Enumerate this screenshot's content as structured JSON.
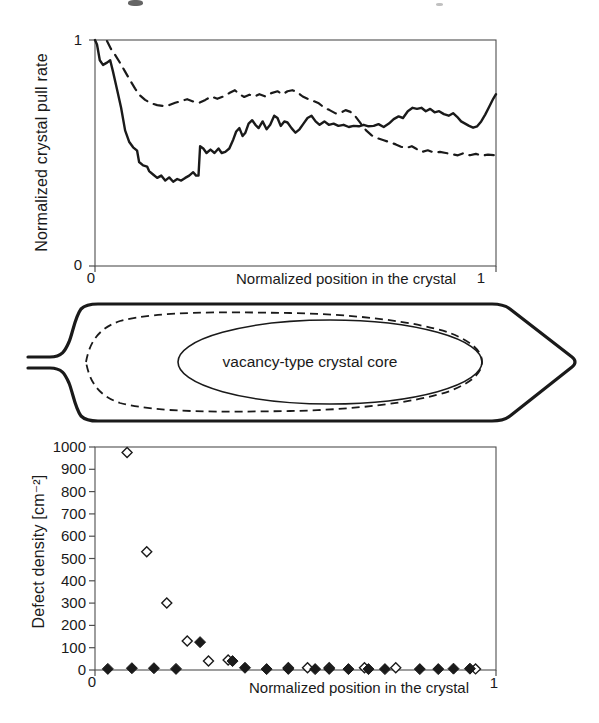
{
  "figure": {
    "top": {
      "ylabel": "Normalized crystal pull rate",
      "xlabel": "Normalized position in the crystal",
      "ytick_top": "1",
      "ytick_bottom": "0",
      "xtick_left": "0",
      "xtick_right": "1"
    },
    "middle": {
      "core_label": "vacancy-type crystal core"
    },
    "bottom": {
      "ylabel": "Defect density [cm⁻²]",
      "xlabel": "Normalized  position in the crystal",
      "xtick_left": "0",
      "xtick_right": "1"
    }
  },
  "chart_data": [
    {
      "type": "line",
      "title": "",
      "xlabel": "Normalized position in the crystal",
      "ylabel": "Normalized crystal pull rate",
      "xlim": [
        0,
        1
      ],
      "ylim": [
        0,
        1
      ],
      "x_ticks": [
        "0",
        "1"
      ],
      "y_ticks": [
        "0",
        "1"
      ],
      "grid": false,
      "legend": "none",
      "series": [
        {
          "name": "solid-curve",
          "style": "solid",
          "points": [
            [
              0,
              1.0
            ],
            [
              0.005,
              0.98
            ],
            [
              0.012,
              0.91
            ],
            [
              0.02,
              0.89
            ],
            [
              0.03,
              0.9
            ],
            [
              0.038,
              0.91
            ],
            [
              0.045,
              0.86
            ],
            [
              0.055,
              0.78
            ],
            [
              0.065,
              0.7
            ],
            [
              0.075,
              0.6
            ],
            [
              0.085,
              0.55
            ],
            [
              0.095,
              0.525
            ],
            [
              0.105,
              0.51
            ],
            [
              0.11,
              0.46
            ],
            [
              0.12,
              0.445
            ],
            [
              0.13,
              0.44
            ],
            [
              0.135,
              0.42
            ],
            [
              0.145,
              0.405
            ],
            [
              0.155,
              0.39
            ],
            [
              0.165,
              0.4
            ],
            [
              0.175,
              0.378
            ],
            [
              0.185,
              0.392
            ],
            [
              0.195,
              0.373
            ],
            [
              0.205,
              0.385
            ],
            [
              0.215,
              0.378
            ],
            [
              0.225,
              0.39
            ],
            [
              0.235,
              0.4
            ],
            [
              0.245,
              0.415
            ],
            [
              0.252,
              0.4
            ],
            [
              0.258,
              0.4
            ],
            [
              0.262,
              0.53
            ],
            [
              0.27,
              0.52
            ],
            [
              0.278,
              0.5
            ],
            [
              0.288,
              0.515
            ],
            [
              0.298,
              0.5
            ],
            [
              0.308,
              0.52
            ],
            [
              0.316,
              0.5
            ],
            [
              0.325,
              0.505
            ],
            [
              0.335,
              0.52
            ],
            [
              0.345,
              0.56
            ],
            [
              0.352,
              0.595
            ],
            [
              0.36,
              0.61
            ],
            [
              0.368,
              0.575
            ],
            [
              0.375,
              0.59
            ],
            [
              0.383,
              0.63
            ],
            [
              0.392,
              0.645
            ],
            [
              0.4,
              0.625
            ],
            [
              0.408,
              0.61
            ],
            [
              0.418,
              0.64
            ],
            [
              0.428,
              0.605
            ],
            [
              0.437,
              0.625
            ],
            [
              0.447,
              0.665
            ],
            [
              0.455,
              0.655
            ],
            [
              0.463,
              0.62
            ],
            [
              0.472,
              0.64
            ],
            [
              0.48,
              0.635
            ],
            [
              0.49,
              0.61
            ],
            [
              0.5,
              0.59
            ],
            [
              0.51,
              0.605
            ],
            [
              0.52,
              0.63
            ],
            [
              0.53,
              0.655
            ],
            [
              0.54,
              0.665
            ],
            [
              0.55,
              0.64
            ],
            [
              0.56,
              0.625
            ],
            [
              0.572,
              0.64
            ],
            [
              0.583,
              0.625
            ],
            [
              0.595,
              0.63
            ],
            [
              0.607,
              0.62
            ],
            [
              0.62,
              0.625
            ],
            [
              0.633,
              0.615
            ],
            [
              0.645,
              0.62
            ],
            [
              0.658,
              0.618
            ],
            [
              0.67,
              0.625
            ],
            [
              0.682,
              0.618
            ],
            [
              0.695,
              0.62
            ],
            [
              0.707,
              0.628
            ],
            [
              0.72,
              0.615
            ],
            [
              0.733,
              0.63
            ],
            [
              0.745,
              0.65
            ],
            [
              0.757,
              0.662
            ],
            [
              0.768,
              0.655
            ],
            [
              0.78,
              0.685
            ],
            [
              0.792,
              0.7
            ],
            [
              0.803,
              0.695
            ],
            [
              0.814,
              0.7
            ],
            [
              0.825,
              0.685
            ],
            [
              0.836,
              0.695
            ],
            [
              0.847,
              0.68
            ],
            [
              0.858,
              0.685
            ],
            [
              0.87,
              0.672
            ],
            [
              0.882,
              0.665
            ],
            [
              0.893,
              0.676
            ],
            [
              0.903,
              0.66
            ],
            [
              0.913,
              0.64
            ],
            [
              0.923,
              0.63
            ],
            [
              0.933,
              0.62
            ],
            [
              0.943,
              0.612
            ],
            [
              0.953,
              0.618
            ],
            [
              0.963,
              0.64
            ],
            [
              0.973,
              0.67
            ],
            [
              0.983,
              0.705
            ],
            [
              0.993,
              0.74
            ],
            [
              1.0,
              0.76
            ]
          ]
        },
        {
          "name": "dashed-curve",
          "style": "dashed",
          "points": [
            [
              0.03,
              0.995
            ],
            [
              0.04,
              0.96
            ],
            [
              0.05,
              0.935
            ],
            [
              0.062,
              0.9
            ],
            [
              0.075,
              0.86
            ],
            [
              0.088,
              0.82
            ],
            [
              0.1,
              0.785
            ],
            [
              0.112,
              0.755
            ],
            [
              0.125,
              0.735
            ],
            [
              0.14,
              0.72
            ],
            [
              0.155,
              0.712
            ],
            [
              0.17,
              0.708
            ],
            [
              0.185,
              0.712
            ],
            [
              0.2,
              0.722
            ],
            [
              0.215,
              0.73
            ],
            [
              0.23,
              0.738
            ],
            [
              0.245,
              0.728
            ],
            [
              0.26,
              0.722
            ],
            [
              0.275,
              0.735
            ],
            [
              0.29,
              0.75
            ],
            [
              0.305,
              0.74
            ],
            [
              0.32,
              0.75
            ],
            [
              0.335,
              0.765
            ],
            [
              0.349,
              0.778
            ],
            [
              0.36,
              0.76
            ],
            [
              0.372,
              0.748
            ],
            [
              0.385,
              0.758
            ],
            [
              0.398,
              0.75
            ],
            [
              0.41,
              0.76
            ],
            [
              0.425,
              0.75
            ],
            [
              0.44,
              0.765
            ],
            [
              0.455,
              0.773
            ],
            [
              0.468,
              0.76
            ],
            [
              0.48,
              0.773
            ],
            [
              0.492,
              0.778
            ],
            [
              0.505,
              0.768
            ],
            [
              0.518,
              0.75
            ],
            [
              0.53,
              0.74
            ],
            [
              0.545,
              0.73
            ],
            [
              0.558,
              0.72
            ],
            [
              0.572,
              0.7
            ],
            [
              0.585,
              0.69
            ],
            [
              0.6,
              0.675
            ],
            [
              0.613,
              0.678
            ],
            [
              0.625,
              0.69
            ],
            [
              0.637,
              0.682
            ],
            [
              0.65,
              0.66
            ],
            [
              0.663,
              0.63
            ],
            [
              0.676,
              0.6
            ],
            [
              0.69,
              0.578
            ],
            [
              0.705,
              0.565
            ],
            [
              0.72,
              0.556
            ],
            [
              0.735,
              0.548
            ],
            [
              0.75,
              0.538
            ],
            [
              0.763,
              0.528
            ],
            [
              0.776,
              0.522
            ],
            [
              0.79,
              0.53
            ],
            [
              0.8,
              0.52
            ],
            [
              0.815,
              0.505
            ],
            [
              0.83,
              0.512
            ],
            [
              0.845,
              0.502
            ],
            [
              0.86,
              0.505
            ],
            [
              0.875,
              0.5
            ],
            [
              0.89,
              0.495
            ],
            [
              0.905,
              0.49
            ],
            [
              0.92,
              0.5
            ],
            [
              0.935,
              0.49
            ],
            [
              0.95,
              0.496
            ],
            [
              0.965,
              0.488
            ],
            [
              0.98,
              0.493
            ],
            [
              1.0,
              0.49
            ]
          ]
        }
      ]
    },
    {
      "type": "diagram",
      "label": "vacancy-type crystal core",
      "description": "Crystal ingot outline: seed neck at left, shoulder, long cylindrical body, conical tail at right; dashed boundary curve and inner solid ellipse marking the vacancy-type crystal core"
    },
    {
      "type": "scatter",
      "title": "",
      "xlabel": "Normalized  position in the crystal",
      "ylabel": "Defect density [cm⁻²]",
      "xlim": [
        0,
        1
      ],
      "ylim": [
        0,
        1000
      ],
      "x_ticks": [
        "0",
        "1"
      ],
      "y_ticks": [
        "0",
        "100",
        "200",
        "300",
        "400",
        "500",
        "600",
        "700",
        "800",
        "900",
        "1000"
      ],
      "grid": false,
      "legend": "none",
      "series": [
        {
          "name": "open-diamonds",
          "marker": "open-diamond",
          "points": [
            [
              0.08,
              975
            ],
            [
              0.129,
              530
            ],
            [
              0.179,
              300
            ],
            [
              0.23,
              130
            ],
            [
              0.283,
              40
            ],
            [
              0.332,
              45
            ],
            [
              0.482,
              10
            ],
            [
              0.53,
              10
            ],
            [
              0.584,
              10
            ],
            [
              0.672,
              10
            ],
            [
              0.75,
              10
            ],
            [
              0.949,
              5
            ]
          ]
        },
        {
          "name": "filled-diamonds",
          "marker": "filled-diamond",
          "points": [
            [
              0.032,
              5
            ],
            [
              0.092,
              8
            ],
            [
              0.147,
              8
            ],
            [
              0.202,
              5
            ],
            [
              0.262,
              125
            ],
            [
              0.343,
              40
            ],
            [
              0.374,
              10
            ],
            [
              0.428,
              4
            ],
            [
              0.482,
              5
            ],
            [
              0.549,
              4
            ],
            [
              0.584,
              5
            ],
            [
              0.632,
              4
            ],
            [
              0.682,
              4
            ],
            [
              0.723,
              4
            ],
            [
              0.81,
              4
            ],
            [
              0.856,
              4
            ],
            [
              0.894,
              6
            ],
            [
              0.935,
              6
            ]
          ]
        }
      ]
    }
  ]
}
